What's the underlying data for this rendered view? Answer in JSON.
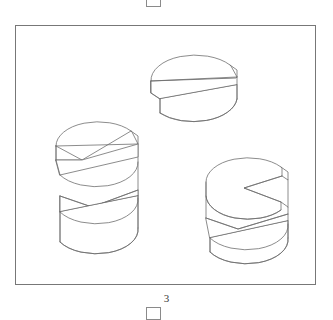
{
  "page": {
    "background_color": "#ffffff",
    "line_color": "#6f6f6f",
    "frame_color": "#777777",
    "crop_mark_color": "#8a8a8a"
  },
  "figure": {
    "caption": "3",
    "frame": {
      "x": 15,
      "y": 25,
      "width": 301,
      "height": 260
    }
  },
  "crop_marks": {
    "top_label": "crop-mark-top",
    "bottom_label": "crop-mark-bottom"
  },
  "objects": [
    {
      "id": "solid-upper-right",
      "name": "cylinder-with-diagonal-slot",
      "description": "Isometric cylinder with a wedge-shaped slot cut diagonally through its body",
      "center_x": 197,
      "center_y": 100
    },
    {
      "id": "solid-left",
      "name": "tall-cylinder-with-two-wedge-cuts",
      "description": "Tall isometric cylinder with two opposing wedge cuts forming an S-profile",
      "center_x": 96,
      "center_y": 188
    },
    {
      "id": "solid-lower-right",
      "name": "cylinder-with-stepped-notch",
      "description": "Isometric cylinder with a V-notch on top and a wedge slot on the lower body",
      "center_x": 248,
      "center_y": 200
    }
  ]
}
